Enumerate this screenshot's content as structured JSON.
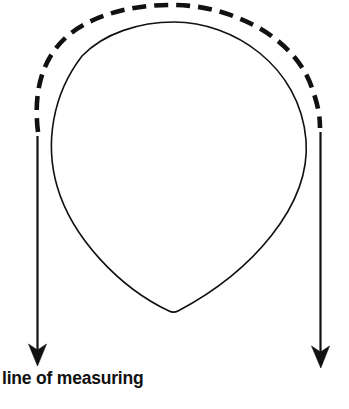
{
  "figure": {
    "title": "line of measuring",
    "background_color": "#ffffff",
    "ink_color": "#111111",
    "width": 349,
    "height": 409,
    "caption": {
      "text": "line of measuring",
      "x": 2,
      "y": 370,
      "weight": "bold",
      "size_px": 17.5
    },
    "clipped_caption": {
      "text": "",
      "note_visible": false
    },
    "elements": {
      "outline_name": "teardrop-outline",
      "dashed_name": "dashed-measuring-arc",
      "left_arrow_name": "left-measuring-arrow",
      "right_arrow_name": "right-measuring-arrow"
    },
    "strokes": {
      "outline_width": 1.6,
      "dashed_width": 4.6,
      "dash_pattern": "14 8",
      "arrow_shaft_width": 2.2
    },
    "geometry": {
      "teardrop_top_y": 22,
      "teardrop_bottom_y": 312,
      "teardrop_left_x": 50,
      "teardrop_right_x": 308,
      "dash_arc_start_x": 38,
      "dash_arc_start_y": 132,
      "dash_arc_end_x": 320,
      "dash_arc_end_y": 128,
      "left_arrow_tip_x": 37,
      "left_arrow_tip_y": 366,
      "right_arrow_tip_x": 321,
      "right_arrow_tip_y": 368
    }
  }
}
